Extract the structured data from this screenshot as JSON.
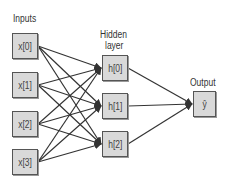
{
  "diagram": {
    "type": "neural-network",
    "layers": [
      {
        "id": "input",
        "title": "Inputs",
        "nodes": [
          "x[0]",
          "x[1]",
          "x[2]",
          "x[3]"
        ]
      },
      {
        "id": "hidden",
        "title_line1": "Hidden",
        "title_line2": "layer",
        "nodes": [
          "h[0]",
          "h[1]",
          "h[2]"
        ]
      },
      {
        "id": "output",
        "title": "Output",
        "nodes": [
          "ŷ"
        ]
      }
    ],
    "connections": "fully-connected",
    "colors": {
      "node_fill": "#d9d9d9",
      "node_border": "#555555",
      "edge": "#333333",
      "text": "#333333"
    }
  }
}
